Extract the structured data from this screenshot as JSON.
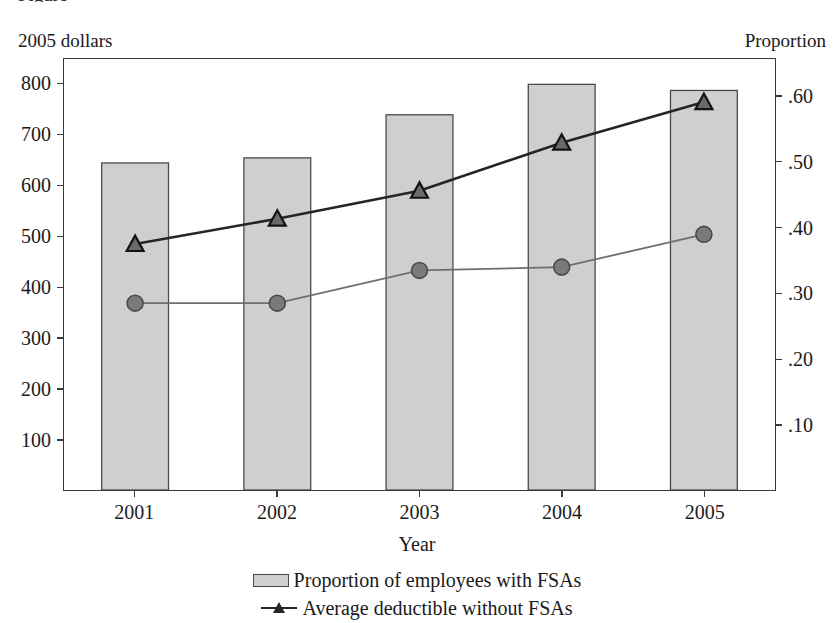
{
  "figure": {
    "clipped_top_text": "Figure",
    "left_axis_caption": "2005 dollars",
    "right_axis_caption": "Proportion",
    "xaxis_title": "Year"
  },
  "legend": {
    "items": [
      {
        "label": "Proportion of employees with FSAs",
        "marker": "bar-swatch",
        "color": "#cfcfcf"
      },
      {
        "label": "Average deductible without FSAs",
        "marker": "triangle-line",
        "color": "#252525"
      }
    ]
  },
  "chart_data": {
    "type": "bar",
    "title": "",
    "xlabel": "Year",
    "ylabel": "2005 dollars",
    "y2label": "Proportion",
    "categories": [
      "2001",
      "2002",
      "2003",
      "2004",
      "2005"
    ],
    "ylim": [
      0,
      850
    ],
    "y2lim": [
      0,
      0.6575
    ],
    "yticks": [
      100,
      200,
      300,
      400,
      500,
      600,
      700,
      800
    ],
    "ytick_labels": [
      "100",
      "200",
      "300",
      "400",
      "500",
      "600",
      "700",
      "800"
    ],
    "y2ticks": [
      0.1,
      0.2,
      0.3,
      0.4,
      0.5,
      0.6
    ],
    "y2tick_labels": [
      ".10",
      ".20",
      ".30",
      ".40",
      ".50",
      ".60"
    ],
    "grid": false,
    "legend_position": "bottom",
    "series": [
      {
        "name": "Average deductible with FSAs",
        "type": "bar",
        "axis": "left",
        "values": [
          645,
          655,
          740,
          800,
          788
        ],
        "fill": "#cfcfcf",
        "stroke": "#4a4a4a"
      },
      {
        "name": "Average deductible without FSAs",
        "type": "line",
        "marker": "triangle",
        "axis": "left",
        "values": [
          485,
          535,
          590,
          685,
          765
        ],
        "color": "#252525"
      },
      {
        "name": "Proportion of employees with FSAs",
        "type": "line",
        "marker": "circle",
        "axis": "right",
        "values": [
          0.285,
          0.285,
          0.335,
          0.34,
          0.39
        ],
        "color": "#6e6e6e"
      }
    ]
  }
}
